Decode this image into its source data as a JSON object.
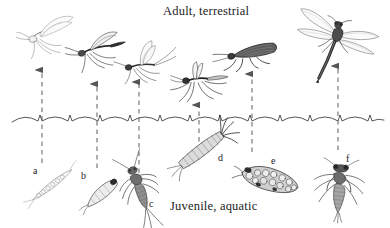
{
  "figure": {
    "title_top": "Adult, terrestrial",
    "title_bottom": "Juvenile, aquatic",
    "background_color": "#ffffff",
    "ink_color": "#1a1a1a",
    "arrow_color": "#555555",
    "waterline_color": "#3a3a3a",
    "width": 390,
    "height": 228
  },
  "labels": [
    {
      "id": "a",
      "text": "a",
      "x": 33,
      "y": 165,
      "subject": "mosquito-larva"
    },
    {
      "id": "b",
      "text": "b",
      "x": 81,
      "y": 170,
      "subject": "midge-larva"
    },
    {
      "id": "c",
      "text": "c",
      "x": 149,
      "y": 198,
      "subject": "mayfly-nymph"
    },
    {
      "id": "d",
      "text": "d",
      "x": 218,
      "y": 152,
      "subject": "caddisfly-larval-case"
    },
    {
      "id": "e",
      "text": "e",
      "x": 271,
      "y": 155,
      "subject": "caddisfly-pupa"
    },
    {
      "id": "f",
      "text": "f",
      "x": 346,
      "y": 153,
      "subject": "dragonfly-nymph"
    }
  ],
  "arrows": [
    {
      "id": "arrow-a",
      "x": 42,
      "y_top": 70,
      "y_bottom": 163
    },
    {
      "id": "arrow-b",
      "x": 97,
      "y_top": 84,
      "y_bottom": 168
    },
    {
      "id": "arrow-c",
      "x": 139,
      "y_top": 82,
      "y_bottom": 190
    },
    {
      "id": "arrow-d",
      "x": 199,
      "y_top": 105,
      "y_bottom": 150
    },
    {
      "id": "arrow-e",
      "x": 252,
      "y_top": 74,
      "y_bottom": 152
    },
    {
      "id": "arrow-f",
      "x": 338,
      "y_top": 66,
      "y_bottom": 150
    }
  ],
  "waterline": {
    "y": 120,
    "amplitude": 7,
    "period": 26,
    "count": 15
  },
  "adults": [
    {
      "id": "adult-a",
      "name": "adult-midge",
      "x": 48,
      "y": 32
    },
    {
      "id": "adult-b",
      "name": "adult-midge-dark",
      "x": 97,
      "y": 48
    },
    {
      "id": "adult-c",
      "name": "adult-mayfly",
      "x": 142,
      "y": 62
    },
    {
      "id": "adult-d",
      "name": "adult-mosquito",
      "x": 196,
      "y": 80
    },
    {
      "id": "adult-e",
      "name": "adult-caddisfly",
      "x": 250,
      "y": 52
    },
    {
      "id": "adult-f",
      "name": "adult-dragonfly",
      "x": 337,
      "y": 36
    }
  ],
  "juveniles": [
    {
      "id": "juv-a",
      "name": "mosquito-larva",
      "x": 52,
      "y": 185
    },
    {
      "id": "juv-b",
      "name": "midge-larva",
      "x": 101,
      "y": 192
    },
    {
      "id": "juv-c",
      "name": "mayfly-nymph",
      "x": 140,
      "y": 188
    },
    {
      "id": "juv-d",
      "name": "caddisfly-case",
      "x": 201,
      "y": 150
    },
    {
      "id": "juv-e",
      "name": "caddisfly-pupa",
      "x": 268,
      "y": 180
    },
    {
      "id": "juv-f",
      "name": "dragonfly-nymph",
      "x": 340,
      "y": 188
    }
  ]
}
